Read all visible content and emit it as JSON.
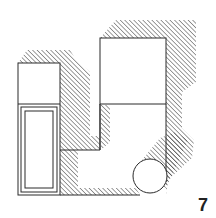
{
  "figure": {
    "label": "7",
    "colors": {
      "ink": "#2a2a2a",
      "paper": "#ffffff",
      "hatch": "#3a3a3a"
    },
    "elements": [
      {
        "name": "left-tall-box",
        "kind": "box"
      },
      {
        "name": "left-inner-panel",
        "kind": "rect"
      },
      {
        "name": "middle-u-connector",
        "kind": "channel"
      },
      {
        "name": "right-upper-cube",
        "kind": "box"
      },
      {
        "name": "right-lower-column",
        "kind": "box"
      },
      {
        "name": "cylinder",
        "kind": "cylinder"
      }
    ]
  }
}
